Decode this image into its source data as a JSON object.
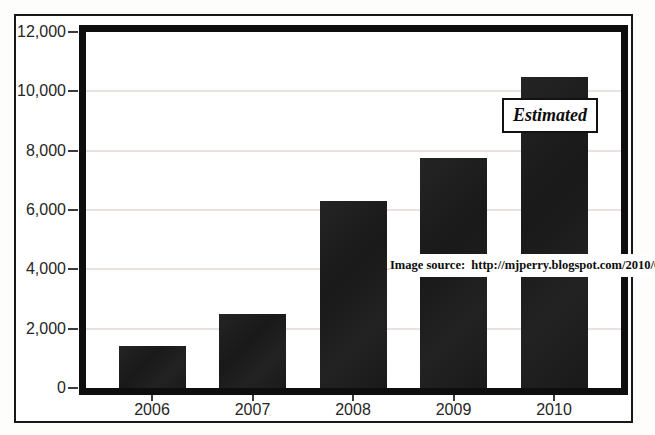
{
  "chart_data": {
    "type": "bar",
    "categories": [
      "2006",
      "2007",
      "2008",
      "2009",
      "2010"
    ],
    "values": [
      1400,
      2500,
      6300,
      7750,
      10500
    ],
    "title": "",
    "xlabel": "",
    "ylabel": "",
    "ylim": [
      0,
      12000
    ],
    "ytick_step": 2000,
    "ytick_labels": [
      "0",
      "2,000",
      "4,000",
      "6,000",
      "8,000",
      "10,000",
      "12,000"
    ],
    "grid": true,
    "legend": "none",
    "bar_color": "#1d1d1d",
    "gridline_color": "#eae2de",
    "frame_color": "#0e0e0e",
    "annotation": "Estimated",
    "annotation_applies_to": "2010",
    "source_note": "Image source:  http://mjperry.blogspot.com/2010/05/"
  }
}
